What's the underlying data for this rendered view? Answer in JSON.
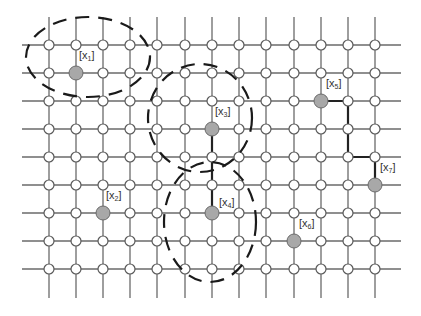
{
  "diagram": {
    "type": "grid-graph-clustering",
    "grid": {
      "columns_x": [
        49,
        76,
        103,
        130,
        157,
        185,
        212,
        239,
        266,
        294,
        321,
        348,
        375
      ],
      "rows_y": [
        45,
        73,
        101,
        129,
        157,
        185,
        213,
        241,
        269
      ],
      "h_line_extent": [
        22,
        401
      ],
      "v_line_extent": [
        17,
        298
      ]
    },
    "anchors": [
      {
        "id": "x1",
        "label_base": "x",
        "label_sub": "1",
        "x": 76,
        "y": 73,
        "label_x": 79,
        "label_y": 50
      },
      {
        "id": "x2",
        "label_base": "x",
        "label_sub": "2",
        "x": 103,
        "y": 213,
        "label_x": 106,
        "label_y": 190
      },
      {
        "id": "x3",
        "label_base": "x",
        "label_sub": "3",
        "x": 212,
        "y": 129,
        "label_x": 215,
        "label_y": 106
      },
      {
        "id": "x4",
        "label_base": "x",
        "label_sub": "4",
        "x": 212,
        "y": 213,
        "label_x": 219,
        "label_y": 197
      },
      {
        "id": "x5",
        "label_base": "x",
        "label_sub": "5",
        "x": 321,
        "y": 101,
        "label_x": 326,
        "label_y": 78
      },
      {
        "id": "x6",
        "label_base": "x",
        "label_sub": "6",
        "x": 294,
        "y": 241,
        "label_x": 299,
        "label_y": 218
      },
      {
        "id": "x7",
        "label_base": "x",
        "label_sub": "7",
        "x": 375,
        "y": 185,
        "label_x": 380,
        "label_y": 162
      }
    ],
    "paths": [
      {
        "from": "x3",
        "to": "x4",
        "points": [
          [
            212,
            129
          ],
          [
            212,
            157
          ],
          [
            212,
            185
          ],
          [
            212,
            213
          ]
        ]
      },
      {
        "from": "x5",
        "to": "x7",
        "points": [
          [
            321,
            101
          ],
          [
            348,
            101
          ],
          [
            348,
            157
          ],
          [
            375,
            157
          ],
          [
            375,
            185
          ]
        ]
      }
    ],
    "clusters": [
      {
        "name": "cluster-x1",
        "cx": 88,
        "cy": 57,
        "rx": 62,
        "ry": 40
      },
      {
        "name": "cluster-x3",
        "cx": 200,
        "cy": 118,
        "rx": 52,
        "ry": 54
      },
      {
        "name": "cluster-x4",
        "cx": 210,
        "cy": 222,
        "rx": 46,
        "ry": 60
      }
    ],
    "colors": {
      "grid_line": "#6a6a6a",
      "node_fill": "#ffffff",
      "anchor_fill": "#a8a8a8",
      "path": "#222222",
      "cluster": "#1a1a1a"
    }
  }
}
